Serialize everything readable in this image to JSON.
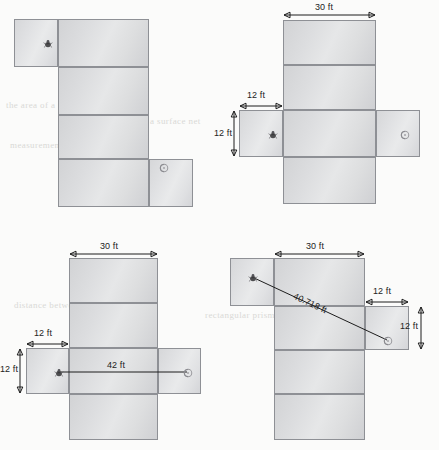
{
  "page": {
    "kind": "geometry-figure-sheet",
    "figure_count": 4,
    "background_bleed_text": [
      "the area of a polygon",
      "a surface net",
      "measurement tool",
      "rectangular prism",
      "distance between"
    ]
  },
  "colors": {
    "tile_fill_light": "#e6e7e8",
    "tile_fill_dark": "#cfd0d3",
    "tile_border": "#8e9095",
    "dimension_line": "#1d1d1d",
    "measure_line": "#4a4a4a",
    "label_text": "#232323",
    "page_background": "#fbfbfa",
    "bleed_text": "#d9d9d6"
  },
  "figures": [
    {
      "id": "figure-1",
      "name": "net-unmeasured",
      "caption": "",
      "labels": [],
      "markers": [
        {
          "name": "start-marker",
          "style": "dark"
        },
        {
          "name": "end-marker",
          "style": "light"
        }
      ]
    },
    {
      "id": "figure-2",
      "name": "net-with-side-dimensions",
      "caption": "",
      "labels": [
        {
          "name": "width-label",
          "text": "30 ft"
        },
        {
          "name": "wing-width-label",
          "text": "12 ft"
        },
        {
          "name": "wing-height-label",
          "text": "12 ft"
        }
      ],
      "markers": [
        {
          "name": "start-marker",
          "style": "dark"
        },
        {
          "name": "end-marker",
          "style": "light"
        }
      ]
    },
    {
      "id": "figure-3",
      "name": "net-with-horizontal-measurement",
      "caption": "",
      "labels": [
        {
          "name": "width-label",
          "text": "30 ft"
        },
        {
          "name": "wing-width-label",
          "text": "12 ft"
        },
        {
          "name": "wing-height-label",
          "text": "12 ft"
        },
        {
          "name": "measured-distance-label",
          "text": "42 ft"
        }
      ],
      "markers": [
        {
          "name": "start-marker",
          "style": "dark"
        },
        {
          "name": "end-marker",
          "style": "light"
        }
      ]
    },
    {
      "id": "figure-4",
      "name": "net-with-diagonal-measurement",
      "caption": "",
      "labels": [
        {
          "name": "width-label",
          "text": "30 ft"
        },
        {
          "name": "wing-width-label",
          "text": "12 ft"
        },
        {
          "name": "wing-height-label",
          "text": "12 ft"
        },
        {
          "name": "measured-distance-label",
          "text": "40.718 ft"
        }
      ],
      "markers": [
        {
          "name": "start-marker",
          "style": "dark"
        },
        {
          "name": "end-marker",
          "style": "light"
        }
      ]
    }
  ]
}
